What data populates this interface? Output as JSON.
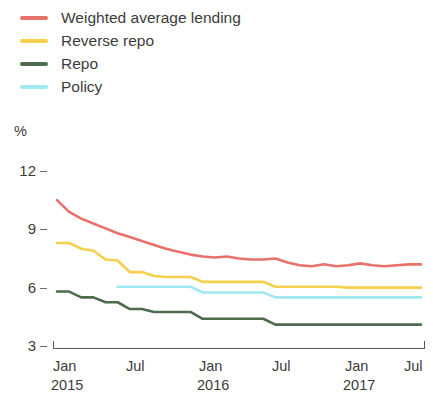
{
  "chart_data": {
    "type": "line",
    "title": "",
    "subtitle": "",
    "xlabel": "",
    "ylabel": "%",
    "ylim": [
      3,
      12
    ],
    "y_ticks": [
      12,
      9,
      6,
      3
    ],
    "grid": false,
    "legend_position": "top-left",
    "x_tick_labels": [
      "Jan",
      "Jul",
      "Jan",
      "Jul",
      "Jan",
      "Jul"
    ],
    "x_tick_years": [
      "2015",
      "",
      "2016",
      "",
      "2017",
      ""
    ],
    "x_range": [
      "2015-01",
      "2017-07"
    ],
    "x": [
      "2015-01",
      "2015-02",
      "2015-03",
      "2015-04",
      "2015-05",
      "2015-06",
      "2015-07",
      "2015-08",
      "2015-09",
      "2015-10",
      "2015-11",
      "2015-12",
      "2016-01",
      "2016-02",
      "2016-03",
      "2016-04",
      "2016-05",
      "2016-06",
      "2016-07",
      "2016-08",
      "2016-09",
      "2016-10",
      "2016-11",
      "2016-12",
      "2017-01",
      "2017-02",
      "2017-03",
      "2017-04",
      "2017-05",
      "2017-06",
      "2017-07"
    ],
    "series": [
      {
        "name": "Weighted average lending",
        "color": "#e8716b",
        "values": [
          10.5,
          9.9,
          9.55,
          9.3,
          9.05,
          8.8,
          8.6,
          8.4,
          8.2,
          8.0,
          7.85,
          7.7,
          7.6,
          7.55,
          7.6,
          7.5,
          7.45,
          7.45,
          7.5,
          7.3,
          7.15,
          7.1,
          7.2,
          7.1,
          7.15,
          7.25,
          7.15,
          7.1,
          7.15,
          7.2,
          7.2
        ]
      },
      {
        "name": "Reverse repo",
        "color": "#f5d04e",
        "values": [
          8.3,
          8.3,
          8.0,
          7.9,
          7.45,
          7.4,
          6.8,
          6.8,
          6.6,
          6.55,
          6.55,
          6.55,
          6.3,
          6.3,
          6.3,
          6.3,
          6.3,
          6.3,
          6.05,
          6.05,
          6.05,
          6.05,
          6.05,
          6.05,
          6.0,
          6.0,
          6.0,
          6.0,
          6.0,
          6.0,
          6.0
        ]
      },
      {
        "name": "Repo",
        "color": "#4e6b50",
        "values": [
          5.8,
          5.8,
          5.5,
          5.5,
          5.25,
          5.25,
          4.9,
          4.9,
          4.75,
          4.75,
          4.75,
          4.75,
          4.4,
          4.4,
          4.4,
          4.4,
          4.4,
          4.4,
          4.1,
          4.1,
          4.1,
          4.1,
          4.1,
          4.1,
          4.1,
          4.1,
          4.1,
          4.1,
          4.1,
          4.1,
          4.1
        ]
      },
      {
        "name": "Policy",
        "color": "#9fe8f2",
        "values": [
          null,
          null,
          null,
          null,
          null,
          6.05,
          6.05,
          6.05,
          6.05,
          6.05,
          6.05,
          6.05,
          5.75,
          5.75,
          5.75,
          5.75,
          5.75,
          5.75,
          5.5,
          5.5,
          5.5,
          5.5,
          5.5,
          5.5,
          5.5,
          5.5,
          5.5,
          5.5,
          5.5,
          5.5,
          5.5
        ]
      }
    ]
  }
}
